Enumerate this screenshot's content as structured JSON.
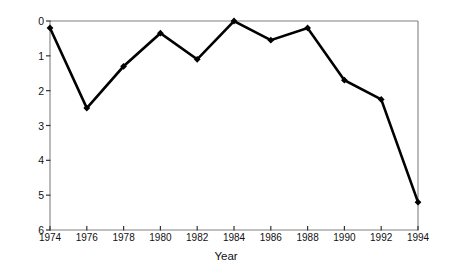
{
  "chart_data": {
    "type": "line",
    "title": "",
    "xlabel": "Year",
    "ylabel": "Percent Dem vote loss due to disapproval",
    "x": [
      1974,
      1976,
      1978,
      1980,
      1982,
      1984,
      1986,
      1988,
      1990,
      1992,
      1994
    ],
    "values": [
      0.2,
      2.5,
      1.3,
      0.35,
      1.1,
      0.0,
      0.55,
      0.2,
      1.7,
      2.25,
      5.2
    ],
    "series": [
      {
        "name": "Percent Dem vote loss due to disapproval",
        "values": [
          0.2,
          2.5,
          1.3,
          0.35,
          1.1,
          0.0,
          0.55,
          0.2,
          1.7,
          2.25,
          5.2
        ]
      }
    ],
    "xtick_labels": [
      "1974",
      "1976",
      "1978",
      "1980",
      "1982",
      "1984",
      "1986",
      "1988",
      "1990",
      "1992",
      "1994"
    ],
    "ytick_labels": [
      "0",
      "1",
      "2",
      "3",
      "4",
      "5",
      "6"
    ],
    "yticks": [
      0,
      1,
      2,
      3,
      4,
      5,
      6
    ],
    "xlim": [
      1974,
      1994
    ],
    "ylim": [
      0,
      6
    ],
    "y_axis_inverted": true,
    "grid": false,
    "legend": false,
    "marker": "filled-diamond",
    "line_color": "#000000",
    "marker_color": "#000000",
    "axis_color": "#808080",
    "background_color": "#ffffff"
  }
}
